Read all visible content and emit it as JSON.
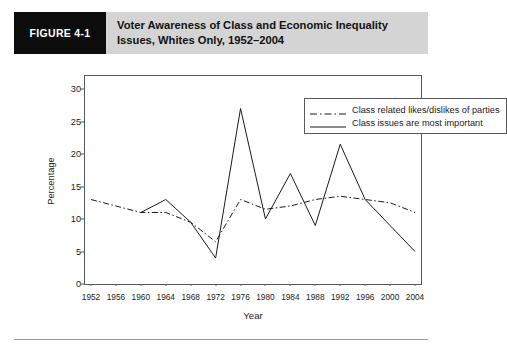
{
  "figure": {
    "tag": "FIGURE 4-1",
    "title": "Voter Awareness of Class and Economic Inequality Issues, Whites Only, 1952–2004"
  },
  "colors": {
    "banner_background": "#d4d4d4",
    "tag_background": "#0c0c0c",
    "tag_text": "#ffffff",
    "axis": "#58585a",
    "series_line": "#1a1a1a",
    "plot_background": "#ffffff"
  },
  "legend": {
    "position": "top-right-inside",
    "entries": [
      {
        "label": "Class related likes/dislikes of parties",
        "style": "dash-dot"
      },
      {
        "label": "Class issues are most important",
        "style": "solid"
      }
    ]
  },
  "chart_data": {
    "type": "line",
    "title": "Voter Awareness of Class and Economic Inequality Issues, Whites Only, 1952–2004",
    "xlabel": "Year",
    "ylabel": "Percentage",
    "x": [
      1952,
      1956,
      1960,
      1964,
      1968,
      1972,
      1976,
      1980,
      1984,
      1988,
      1992,
      1996,
      2000,
      2004
    ],
    "xlim": [
      1952,
      2004
    ],
    "ylim": [
      0,
      32
    ],
    "yticks": [
      0,
      5,
      10,
      15,
      20,
      25,
      30
    ],
    "xticks": [
      1952,
      1956,
      1960,
      1964,
      1968,
      1972,
      1976,
      1980,
      1984,
      1988,
      1992,
      1996,
      2000,
      2004
    ],
    "grid": false,
    "series": [
      {
        "name": "Class related likes/dislikes of parties",
        "style": "dash-dot",
        "values": [
          13,
          12,
          11,
          11,
          9.5,
          6.5,
          13,
          11.5,
          12,
          13,
          13.5,
          13,
          12.5,
          11
        ]
      },
      {
        "name": "Class issues are most important",
        "style": "solid",
        "values": [
          null,
          null,
          11,
          13,
          9.5,
          4,
          27,
          10,
          17,
          9,
          21.5,
          13,
          9,
          5
        ]
      }
    ]
  }
}
